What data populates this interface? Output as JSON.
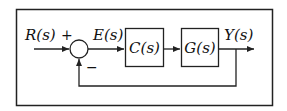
{
  "diagram": {
    "type": "block-diagram",
    "colors": {
      "stroke": "#222222",
      "background": "#ffffff"
    },
    "signals": {
      "input": "R(s)",
      "error": "E(s)",
      "output": "Y(s)"
    },
    "summing_junction": {
      "plus_sign": "+",
      "minus_sign": "−"
    },
    "blocks": [
      {
        "id": "controller",
        "label": "C(s)"
      },
      {
        "id": "plant",
        "label": "G(s)"
      }
    ],
    "connections": [
      {
        "from": "input",
        "to": "summing_junction",
        "label": "R(s)"
      },
      {
        "from": "summing_junction",
        "to": "controller",
        "label": "E(s)"
      },
      {
        "from": "controller",
        "to": "plant",
        "label": ""
      },
      {
        "from": "plant",
        "to": "output",
        "label": "Y(s)"
      },
      {
        "from": "output",
        "to": "summing_junction",
        "label": "feedback (negative)"
      }
    ]
  }
}
